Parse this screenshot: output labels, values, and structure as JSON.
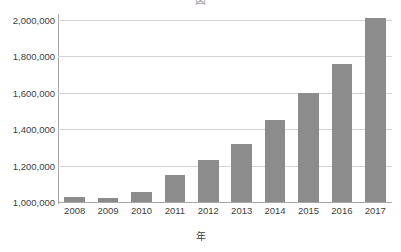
{
  "chart_data": {
    "type": "bar",
    "title": "図　　　　　　　　　　",
    "subtitle": "",
    "xlabel": "年",
    "ylabel": "",
    "categories": [
      "2008",
      "2009",
      "2010",
      "2011",
      "2012",
      "2013",
      "2014",
      "2015",
      "2016",
      "2017"
    ],
    "values": [
      1030000,
      1020000,
      1055000,
      1150000,
      1230000,
      1320000,
      1450000,
      1600000,
      1760000,
      2010000
    ],
    "ylim": [
      1000000,
      2000000
    ],
    "ytick_values": [
      1000000,
      1200000,
      1400000,
      1600000,
      1800000,
      2000000
    ],
    "ytick_labels": [
      "1,000,000",
      "1,200,000",
      "1,400,000",
      "1,600,000",
      "1,800,000",
      "2,000,000"
    ],
    "grid": true,
    "legend": false,
    "legend_position": "none",
    "bar_color": "#8c8c8c",
    "gridline_color": "#d3d3d3",
    "axis_color": "#a6a6a6",
    "background_color": "#ffffff"
  }
}
